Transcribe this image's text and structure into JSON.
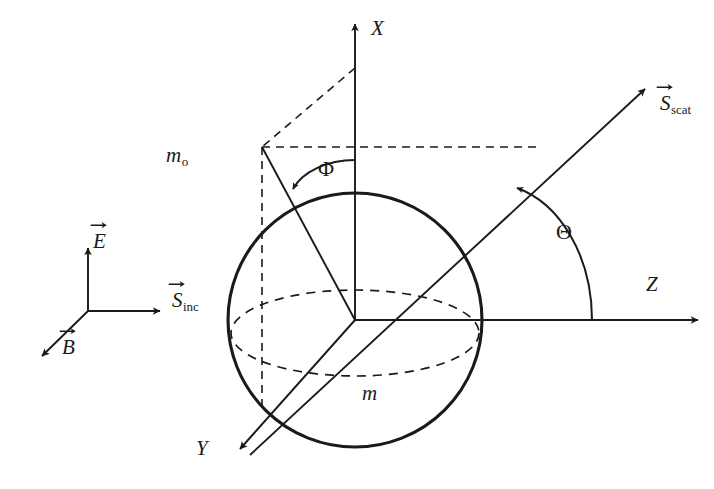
{
  "figure": {
    "background_color": "#ffffff",
    "stroke_color": "#1a1a1a"
  },
  "axes": [
    {
      "name": "x-axis",
      "label": "X",
      "direction": "up",
      "label_pos": [
        371,
        18
      ]
    },
    {
      "name": "y-axis",
      "label": "Y",
      "direction": "down-left",
      "label_pos": [
        196,
        438
      ]
    },
    {
      "name": "z-axis",
      "label": "Z",
      "direction": "right",
      "label_pos": [
        646,
        274
      ]
    }
  ],
  "angles": [
    {
      "name": "phi",
      "label": "Φ",
      "label_pos": [
        318,
        158
      ],
      "from": "x-axis",
      "to": "y-axis-projection"
    },
    {
      "name": "theta",
      "label": "Θ",
      "label_pos": [
        556,
        221
      ],
      "from": "z-axis",
      "to": "scattered-ray"
    }
  ],
  "media": [
    {
      "name": "surrounding-medium",
      "symbol": "m",
      "subscript": "o",
      "label_pos": [
        166,
        145
      ]
    },
    {
      "name": "sphere-medium",
      "symbol": "m",
      "subscript": "",
      "label_pos": [
        362,
        383
      ]
    }
  ],
  "vectors": [
    {
      "name": "electric-field-vector",
      "symbol": "E",
      "subscript": "",
      "label_pos": [
        93,
        231
      ],
      "overarrow": true,
      "direction": "up",
      "group": "incident-triad"
    },
    {
      "name": "magnetic-field-vector",
      "symbol": "B",
      "subscript": "",
      "label_pos": [
        62,
        337
      ],
      "overarrow": true,
      "direction": "down-left",
      "group": "incident-triad"
    },
    {
      "name": "incident-poynting-vector",
      "symbol": "S",
      "subscript": "inc",
      "label_pos": [
        172,
        290
      ],
      "overarrow": true,
      "direction": "right",
      "group": "incident-triad"
    },
    {
      "name": "scattered-poynting-vector",
      "symbol": "S",
      "subscript": "scat",
      "label_pos": [
        660,
        93
      ],
      "overarrow": true,
      "direction": "up-right",
      "group": "scattered-ray"
    }
  ],
  "geometry": {
    "origin": [
      355,
      320
    ],
    "sphere_radius": 127,
    "sphere_outline": "solid",
    "equator_style": "dashed",
    "construction_lines_style": "dashed",
    "triad_origin": [
      88,
      311
    ]
  }
}
